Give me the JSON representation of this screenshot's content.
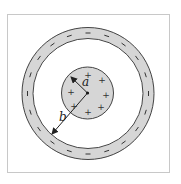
{
  "diagram": {
    "type": "concentric-spheres-cross-section",
    "colors": {
      "background": "#ffffff",
      "frame": "#c8c8c8",
      "fill": "#d6d6d6",
      "stroke": "#444444",
      "text": "#222222"
    },
    "inner_sphere": {
      "radius_label": "a",
      "charge_sign": "+",
      "charge_count": 8
    },
    "outer_shell": {
      "radius_label": "b",
      "charge_sign": "−",
      "charge_count": 20
    },
    "labels": {
      "a": "a",
      "b": "b"
    }
  }
}
